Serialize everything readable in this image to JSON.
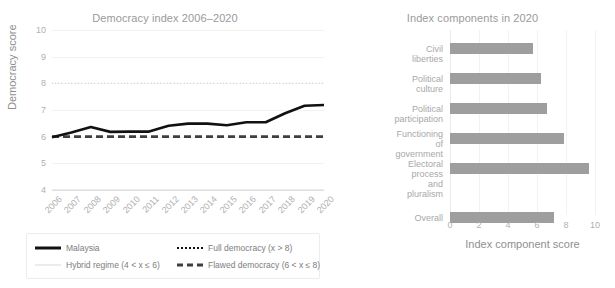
{
  "chart_data": [
    {
      "type": "line",
      "title": "Democracy index 2006–2020",
      "xlabel": "",
      "ylabel": "Democracy score",
      "ylim": [
        4,
        10
      ],
      "yticks": [
        4,
        5,
        6,
        7,
        8,
        9,
        10
      ],
      "grid": true,
      "legend_position": "below",
      "categories": [
        "2006",
        "2007",
        "2008",
        "2009",
        "2010",
        "2011",
        "2012",
        "2013",
        "2014",
        "2015",
        "2016",
        "2017",
        "2018",
        "2019",
        "2020"
      ],
      "series": [
        {
          "name": "Malaysia",
          "style": "solid",
          "color": "#111111",
          "values": [
            5.98,
            6.16,
            6.36,
            6.18,
            6.19,
            6.19,
            6.41,
            6.49,
            6.49,
            6.43,
            6.54,
            6.54,
            6.88,
            7.16,
            7.19
          ]
        },
        {
          "name": "Full democracy (x > 8)",
          "style": "dotted",
          "color": "#111111",
          "threshold": 8
        },
        {
          "name": "Flawed democracy (6 < x ≤ 8)",
          "style": "dashed",
          "color": "#3f3f3f",
          "threshold": 6
        },
        {
          "name": "Hybrid regime (4 < x ≤ 6)",
          "style": "thin-solid",
          "color": "#d9d9d9",
          "threshold": 4
        }
      ]
    },
    {
      "type": "bar",
      "orientation": "horizontal",
      "title": "Index components in 2020",
      "xlabel": "Index component score",
      "ylabel": "",
      "xlim": [
        0,
        10
      ],
      "xticks": [
        0,
        2,
        4,
        6,
        8,
        10
      ],
      "grid": true,
      "bar_color": "#9e9e9e",
      "categories": [
        "Civil liberties",
        "Political culture",
        "Political participation",
        "Functioning of\ngovernment",
        "Electoral process\nand pluralism",
        "Overall"
      ],
      "values": [
        5.74,
        6.25,
        6.67,
        7.86,
        9.58,
        7.19
      ]
    }
  ],
  "line_chart": {
    "title": "Democracy index 2006–2020",
    "ylabel": "Democracy score",
    "yticks": [
      "10",
      "9",
      "8",
      "7",
      "6",
      "5",
      "4"
    ],
    "xticks": [
      "2006",
      "2007",
      "2008",
      "2009",
      "2010",
      "2011",
      "2012",
      "2013",
      "2014",
      "2015",
      "2016",
      "2017",
      "2018",
      "2019",
      "2020"
    ]
  },
  "legend": {
    "entries": [
      {
        "label": "Malaysia",
        "swatch": "solid-line-swatch"
      },
      {
        "label": "Full democracy (x > 8)",
        "swatch": "dotted-line-swatch"
      },
      {
        "label": "Hybrid regime (4 < x ≤ 6)",
        "swatch": "thin-line-swatch"
      },
      {
        "label": "Flawed democracy (6 < x ≤ 8)",
        "swatch": "dashed-line-swatch"
      }
    ]
  },
  "bar_chart": {
    "title": "Index components in 2020",
    "xlabel": "Index component score",
    "xticks": [
      "0",
      "2",
      "4",
      "6",
      "8",
      "10"
    ],
    "categories": [
      {
        "label": "Civil liberties",
        "value": 5.74
      },
      {
        "label": "Political culture",
        "value": 6.25
      },
      {
        "label": "Political participation",
        "value": 6.67
      },
      {
        "label": "Functioning of\ngovernment",
        "value": 7.86
      },
      {
        "label": "Electoral process\nand pluralism",
        "value": 9.58
      },
      {
        "label": "Overall",
        "value": 7.19
      }
    ]
  },
  "colors": {
    "series": "#111111",
    "bar": "#9e9e9e",
    "grid": "#f2f2f2",
    "text": "#a8a8a8"
  }
}
